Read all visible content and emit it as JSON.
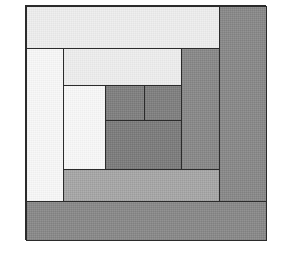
{
  "image": {
    "title": "Log Cabin Quilt Block",
    "width": 282,
    "height": 259,
    "background_color": "#ffffff",
    "outline_color": "#2b2b2b"
  },
  "block": {
    "name": "log-cabin-block",
    "x": 25,
    "y": 5,
    "width": 241,
    "height": 235,
    "rounds": 4,
    "description": "Concentric log cabin piecing: light logs on upper-left half, dark logs on lower-right half"
  },
  "palette": {
    "very_light": "#eeeeee",
    "white": "#f8f8f8",
    "light_gray": "#e9e9e9",
    "medium_light_gray": "#a8a8a8",
    "medium_gray": "#8a8a8a",
    "dark_gray": "#808080",
    "darker_gray": "#7d7d7d",
    "outline": "#2b2b2b"
  },
  "patches": [
    {
      "name": "log-top-outer",
      "label": "top outer light log",
      "color": "#eeeeee",
      "tone": "light",
      "x": 0,
      "y": 0,
      "w": 194,
      "h": 43
    },
    {
      "name": "log-right-outer",
      "label": "right outer dark log",
      "color": "#8a8a8a",
      "tone": "dark",
      "x": 193,
      "y": 0,
      "w": 48,
      "h": 214
    },
    {
      "name": "log-bottom-outer",
      "label": "bottom outer dark log",
      "color": "#8a8a8a",
      "tone": "dark",
      "x": 0,
      "y": 195,
      "w": 241,
      "h": 40
    },
    {
      "name": "log-left-round2",
      "label": "left white log",
      "color": "#f8f8f8",
      "tone": "light",
      "x": 0,
      "y": 42,
      "w": 38,
      "h": 154
    },
    {
      "name": "log-top-round2",
      "label": "second light log",
      "color": "#eeeeee",
      "tone": "light",
      "x": 37,
      "y": 42,
      "w": 119,
      "h": 38
    },
    {
      "name": "log-right-round2",
      "label": "right inner dark log",
      "color": "#8a8a8a",
      "tone": "dark",
      "x": 155,
      "y": 42,
      "w": 39,
      "h": 122
    },
    {
      "name": "log-bottom-round2",
      "label": "bottom medium log",
      "color": "#a8a8a8",
      "tone": "medium",
      "x": 37,
      "y": 163,
      "w": 157,
      "h": 33
    },
    {
      "name": "log-left-round3",
      "label": "inner white log",
      "color": "#f8f8f8",
      "tone": "light",
      "x": 37,
      "y": 79,
      "w": 43,
      "h": 85
    },
    {
      "name": "center-square-left",
      "label": "center dark square left",
      "color": "#808080",
      "tone": "dark",
      "x": 79,
      "y": 79,
      "w": 40,
      "h": 36
    },
    {
      "name": "center-square-right",
      "label": "center dark square right",
      "color": "#808080",
      "tone": "dark",
      "x": 118,
      "y": 79,
      "w": 38,
      "h": 36
    },
    {
      "name": "center-bar-bottom",
      "label": "center dark bar",
      "color": "#7d7d7d",
      "tone": "dark",
      "x": 79,
      "y": 114,
      "w": 77,
      "h": 50
    }
  ]
}
